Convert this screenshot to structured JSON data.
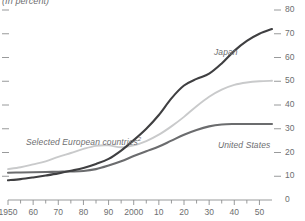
{
  "chart": {
    "title": "(In percent)",
    "colors": {
      "japan": "#3f3f41",
      "europe": "#c9cacb",
      "united_states": "#6b6c6e",
      "axis": "#8d8e90",
      "text": "#6d6e70",
      "background": "#ffffff"
    }
  },
  "labels": {
    "japan": "Japan",
    "europe": "Selected European countries",
    "europe_footnote": "2",
    "united_states": "United States"
  },
  "axes": {
    "y_right_ticks": [
      "80",
      "70",
      "60",
      "50",
      "40",
      "30",
      "20",
      "10",
      "0"
    ],
    "x_ticks": [
      "1950",
      "60",
      "70",
      "80",
      "90",
      "2000",
      "10",
      "20",
      "30",
      "40",
      "50"
    ],
    "x_tick_values": [
      1950,
      1960,
      1970,
      1980,
      1990,
      2000,
      2010,
      2020,
      2030,
      2040,
      2050
    ],
    "x_minor_step": 5,
    "y_min": 0,
    "y_max": 80,
    "x_min": 1950,
    "x_max": 2055
  },
  "chart_data": {
    "type": "line",
    "title": "(In percent)",
    "xlabel": "",
    "ylabel": "",
    "xlim": [
      1950,
      2055
    ],
    "ylim": [
      0,
      80
    ],
    "grid": false,
    "legend": "inline-annotations",
    "x": [
      1950,
      1955,
      1960,
      1965,
      1970,
      1975,
      1980,
      1985,
      1990,
      1995,
      2000,
      2005,
      2010,
      2015,
      2020,
      2025,
      2030,
      2035,
      2040,
      2045,
      2050,
      2055
    ],
    "series": [
      {
        "name": "Japan",
        "color": "#3f3f41",
        "values": [
          8.3,
          8.8,
          9.5,
          10.3,
          11.2,
          12.3,
          13.5,
          15.2,
          17.3,
          20.8,
          25.2,
          30.0,
          35.8,
          42.8,
          48.2,
          51.0,
          53.2,
          57.5,
          62.8,
          67.0,
          70.0,
          72.0
        ]
      },
      {
        "name": "Selected European countries",
        "color": "#c9cacb",
        "values": [
          13.0,
          13.8,
          15.0,
          16.3,
          18.2,
          19.8,
          21.5,
          22.8,
          23.0,
          22.2,
          23.0,
          24.8,
          27.5,
          31.0,
          35.0,
          39.5,
          43.5,
          46.5,
          48.5,
          49.5,
          50.0,
          50.2
        ]
      },
      {
        "name": "United States",
        "color": "#6b6c6e",
        "values": [
          11.5,
          11.6,
          11.7,
          11.8,
          11.9,
          12.0,
          12.2,
          13.0,
          14.5,
          16.3,
          18.5,
          20.5,
          22.5,
          25.0,
          27.5,
          29.5,
          31.0,
          31.8,
          32.0,
          32.0,
          32.0,
          32.0
        ]
      }
    ]
  }
}
